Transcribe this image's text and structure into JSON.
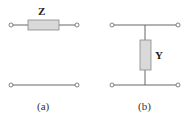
{
  "figure_a": {
    "element_label": "Z",
    "caption": "(a)",
    "element_type": "series impedance"
  },
  "figure_b": {
    "element_label": "Y",
    "caption": "(b)",
    "element_type": "shunt admittance"
  },
  "colors": {
    "wire": "#666666",
    "box_fill": "#d9d9d9",
    "box_stroke": "#888888",
    "terminal_fill": "#ffffff"
  }
}
